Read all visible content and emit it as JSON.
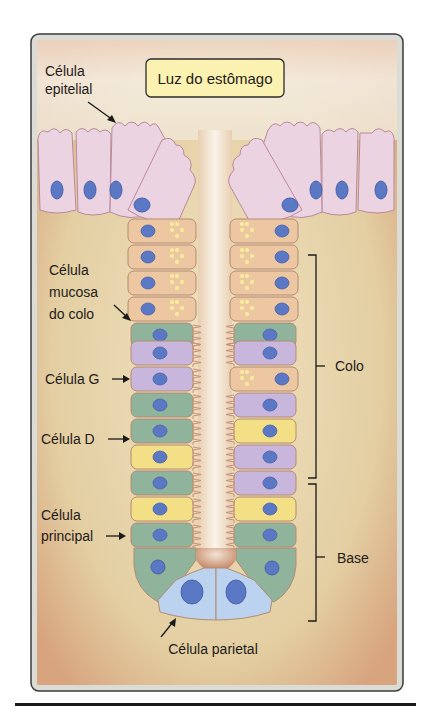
{
  "title_box": {
    "label": "Luz do estômago"
  },
  "labels": {
    "epithelial": [
      "Célula",
      "epitelial"
    ],
    "mucous_neck": [
      "Célula",
      "mucosa",
      "do colo"
    ],
    "g_cell": "Célula G",
    "d_cell": "Célula D",
    "chief": [
      "Célula",
      "principal"
    ],
    "parietal": "Célula parietal",
    "neck_region": "Colo",
    "base_region": "Base"
  },
  "colors": {
    "background_tissue": "#e6d2a8",
    "frame_edge": "#d9a27f",
    "epithelial_cell": "#ecd3e2",
    "mucous_neck_cell": "#edc7a2",
    "g_cell": "#c9b6dc",
    "d_cell": "#8fb39b",
    "chief_cell": "#f3df86",
    "parietal_cell": "#bcd3ef",
    "nucleus": "#5a78c4",
    "title_box_fill": "#fbf1b0"
  },
  "gland": {
    "left_column": [
      "mucous",
      "mucous",
      "mucous",
      "mucous",
      "mucous",
      "d",
      "g",
      "g",
      "d",
      "d",
      "chief",
      "d",
      "chief",
      "d"
    ],
    "right_column": [
      "mucous",
      "mucous",
      "mucous",
      "mucous",
      "mucous",
      "d",
      "g",
      "mucous",
      "g",
      "chief",
      "g",
      "g",
      "chief",
      "d"
    ],
    "bottom": [
      "parietal",
      "parietal"
    ]
  }
}
